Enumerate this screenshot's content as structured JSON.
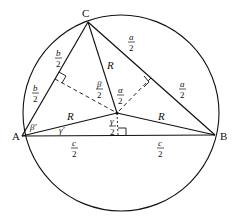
{
  "diagram": {
    "colors": {
      "stroke": "#111111",
      "background": "#ffffff"
    },
    "vertices": {
      "A": {
        "label": "A",
        "x": 22,
        "y": 136
      },
      "B": {
        "label": "B",
        "x": 215,
        "y": 135
      },
      "C": {
        "label": "C",
        "x": 88,
        "y": 22
      },
      "O": {
        "label": "",
        "x": 117,
        "y": 113
      }
    },
    "circle": {
      "cx": 121,
      "cy": 113,
      "r": 98
    },
    "side_labels": {
      "b_half_upper": {
        "num": "b",
        "den": "2"
      },
      "b_half_lower": {
        "num": "b",
        "den": "2"
      },
      "a_half_upper": {
        "num": "a",
        "den": "2"
      },
      "a_half_lower": {
        "num": "a",
        "den": "2"
      },
      "c_half_left": {
        "num": "c",
        "den": "2"
      },
      "c_half_right": {
        "num": "c",
        "den": "2"
      }
    },
    "radius_labels": {
      "R_CO": "R",
      "R_AO": "R",
      "R_BO": "R"
    },
    "angle_labels": {
      "beta_half": {
        "num": "β",
        "den": "2"
      },
      "alpha_half": {
        "num": "α",
        "den": "2"
      },
      "gamma_half": {
        "num": "γ",
        "den": "2"
      },
      "beta_prime": "β'",
      "gamma_prime": "γ'"
    }
  }
}
